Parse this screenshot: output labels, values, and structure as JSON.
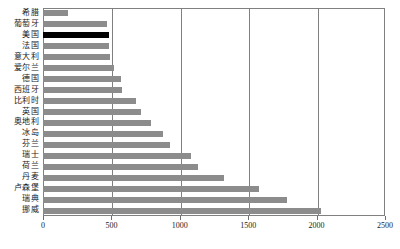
{
  "chart_data": {
    "type": "bar",
    "orientation": "horizontal",
    "title": "",
    "xlabel": "",
    "ylabel": "",
    "xlim": [
      0,
      2500
    ],
    "xticks": [
      0,
      500,
      1000,
      1500,
      2000,
      2500
    ],
    "xtick_labels": [
      "0",
      "500",
      "1000",
      "1500",
      "2000",
      "2500"
    ],
    "grid": true,
    "grid_axis": "x",
    "legend": false,
    "categories": [
      "希腊",
      "葡萄牙",
      "美国",
      "法国",
      "意大利",
      "爱尔兰",
      "德国",
      "西班牙",
      "比利时",
      "英国",
      "奥地利",
      "冰岛",
      "芬兰",
      "瑞士",
      "荷兰",
      "丹麦",
      "卢森堡",
      "瑞典",
      "挪威"
    ],
    "values": [
      185,
      470,
      480,
      480,
      490,
      520,
      570,
      580,
      680,
      720,
      790,
      880,
      930,
      1080,
      1130,
      1320,
      1580,
      1780,
      2030
    ],
    "highlight_index": 2,
    "colors": {
      "bar": "#8c8c8c",
      "highlight_bar": "#000000",
      "axis": "#808080",
      "grid": "#808080",
      "text": "#1a1a1a",
      "background": "#ffffff"
    }
  }
}
